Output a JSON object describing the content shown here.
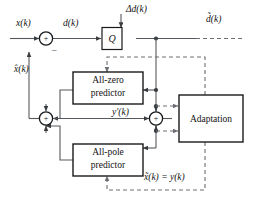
{
  "figure": {
    "type": "block-diagram"
  },
  "blocks": {
    "quantizer": {
      "label": "Q",
      "name": "quantizer-block"
    },
    "all_zero": {
      "line1": "All-zero",
      "line2": "predictor",
      "name": "all-zero-predictor-block"
    },
    "all_pole": {
      "line1": "All-pole",
      "line2": "predictor",
      "name": "all-pole-predictor-block"
    },
    "adaptation": {
      "label": "Adaptation",
      "name": "adaptation-block"
    }
  },
  "adders": {
    "input_adder": {
      "plus": "+",
      "minus": "–"
    },
    "left_adder": {
      "plus": "+"
    },
    "right_adder": {
      "plus": "+"
    }
  },
  "signals": {
    "input": "x(k)",
    "difference": "d(k)",
    "quant_noise": "Δd(k)",
    "quantized_out": "d̃(k)",
    "predicted": "x̂(k)",
    "y_prime": "y′(k)",
    "reconstructed": "x̃(k) = y(k)"
  },
  "colors": {
    "wire": "#55585c",
    "dashed_wire": "#6b6e72",
    "box_stroke": "#1a1a1a",
    "text": "#111111",
    "background": "#ffffff"
  }
}
